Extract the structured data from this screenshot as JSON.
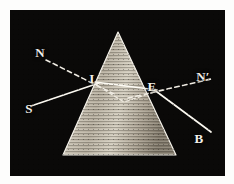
{
  "figure": {
    "plate_background": "#0a0908",
    "ink_color": "#f2efe8",
    "border_color": "#fdfdfc"
  },
  "prism": {
    "name": "triangular-glass-prism",
    "fill_light": "#d8d3c6",
    "fill_dark": "#8d8577",
    "apex": {
      "x": 108,
      "y": 22
    },
    "base_left": {
      "x": 53,
      "y": 145
    },
    "base_right": {
      "x": 166,
      "y": 145
    }
  },
  "points": [
    {
      "id": "I",
      "label": "I",
      "x": 84,
      "y": 68,
      "desc": "entry point on first prism face"
    },
    {
      "id": "E",
      "label": "E",
      "x": 142,
      "y": 76,
      "desc": "exit point on second prism face"
    }
  ],
  "labels": [
    {
      "id": "N",
      "label": "N",
      "x": 30,
      "y": 42,
      "prime": false
    },
    {
      "id": "I",
      "label": "I",
      "x": 82,
      "y": 68,
      "prime": false
    },
    {
      "id": "E",
      "label": "E",
      "x": 142,
      "y": 76,
      "prime": false
    },
    {
      "id": "N1",
      "label": "N",
      "x": 193,
      "y": 66,
      "prime": true
    },
    {
      "id": "S",
      "label": "S",
      "x": 19,
      "y": 98,
      "prime": false
    },
    {
      "id": "B",
      "label": "B",
      "x": 189,
      "y": 128,
      "prime": false
    }
  ],
  "rays": [
    {
      "name": "incident-ray-S-to-I",
      "style": "solid",
      "from": {
        "x": 22,
        "y": 95
      },
      "to": {
        "x": 88,
        "y": 73
      }
    },
    {
      "name": "internal-ray-I-to-E",
      "style": "solid",
      "from": {
        "x": 86,
        "y": 72
      },
      "to": {
        "x": 146,
        "y": 80
      }
    },
    {
      "name": "emergent-ray-E-to-B",
      "style": "solid",
      "from": {
        "x": 144,
        "y": 79
      },
      "to": {
        "x": 200,
        "y": 122
      }
    },
    {
      "name": "normal-at-I",
      "style": "dashed",
      "from": {
        "x": 36,
        "y": 50
      },
      "to": {
        "x": 104,
        "y": 84
      }
    },
    {
      "name": "normal-at-E",
      "style": "dashed",
      "from": {
        "x": 118,
        "y": 88
      },
      "to": {
        "x": 200,
        "y": 70
      }
    },
    {
      "name": "dispersion-fan-lower",
      "style": "dashed",
      "from": {
        "x": 88,
        "y": 76
      },
      "to": {
        "x": 144,
        "y": 82
      }
    }
  ],
  "dispersion": {
    "name": "dispersed-beam-inside-prism",
    "vertex": {
      "x": 114,
      "y": 92
    }
  }
}
